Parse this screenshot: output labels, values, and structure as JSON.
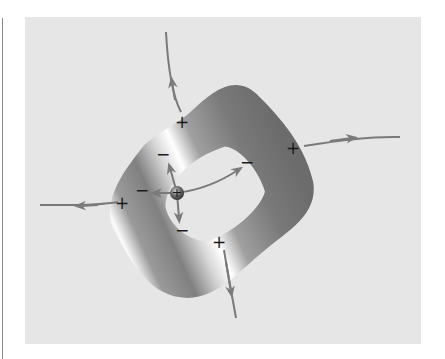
{
  "diagram": {
    "title": "",
    "surface": "toroidal-conductor-surface",
    "charge_signs": {
      "outer": [
        "+",
        "+",
        "+",
        "+"
      ],
      "inner": [
        "−",
        "−",
        "−",
        "−"
      ]
    },
    "central_charge": "+",
    "colors": {
      "background_panel": "#e6e6e6",
      "field_lines": "#7a7a7a",
      "surface_dark": "#6e6e6e",
      "surface_light": "#ffffff",
      "sign_text": "#1a1a1a"
    }
  }
}
